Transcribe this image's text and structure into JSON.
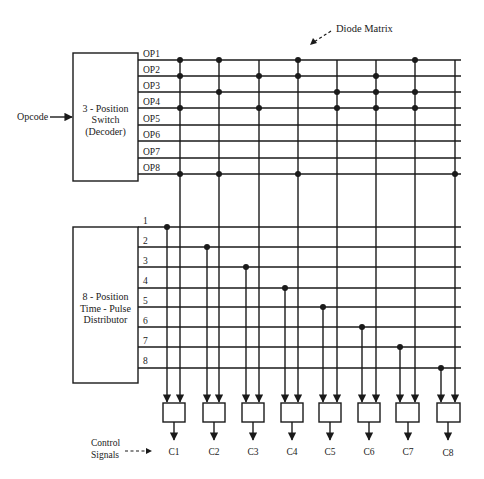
{
  "diagram": {
    "title_label": "Diode Matrix",
    "opcode_input_label": "Opcode",
    "decoder": {
      "line1": "3 - Position",
      "line2": "Switch",
      "line3": "(Decoder)",
      "outputs": [
        "OP1",
        "OP2",
        "OP3",
        "OP4",
        "OP5",
        "OP6",
        "OP7",
        "OP8"
      ]
    },
    "distributor": {
      "line1": "8 - Position",
      "line2": "Time - Pulse",
      "line3": "Distributor",
      "outputs": [
        "1",
        "2",
        "3",
        "4",
        "5",
        "6",
        "7",
        "8"
      ]
    },
    "control_signals_label_line1": "Control",
    "control_signals_label_line2": "Signals",
    "control_outputs": [
      "C1",
      "C2",
      "C3",
      "C4",
      "C5",
      "C6",
      "C7",
      "C8"
    ],
    "diode_connections": [
      {
        "control": "C1",
        "opcodes": [
          "OP1",
          "OP2",
          "OP4",
          "OP8"
        ],
        "time": "1"
      },
      {
        "control": "C2",
        "opcodes": [
          "OP1",
          "OP3",
          "OP8"
        ],
        "time": "2"
      },
      {
        "control": "C3",
        "opcodes": [
          "OP2",
          "OP4"
        ],
        "time": "3"
      },
      {
        "control": "C4",
        "opcodes": [
          "OP1",
          "OP2",
          "OP8"
        ],
        "time": "4"
      },
      {
        "control": "C5",
        "opcodes": [
          "OP3",
          "OP4"
        ],
        "time": "5"
      },
      {
        "control": "C6",
        "opcodes": [
          "OP2",
          "OP3",
          "OP4"
        ],
        "time": "6"
      },
      {
        "control": "C7",
        "opcodes": [
          "OP1",
          "OP3",
          "OP4"
        ],
        "time": "7"
      },
      {
        "control": "C8",
        "opcodes": [
          "OP8"
        ],
        "time": "8"
      }
    ]
  }
}
